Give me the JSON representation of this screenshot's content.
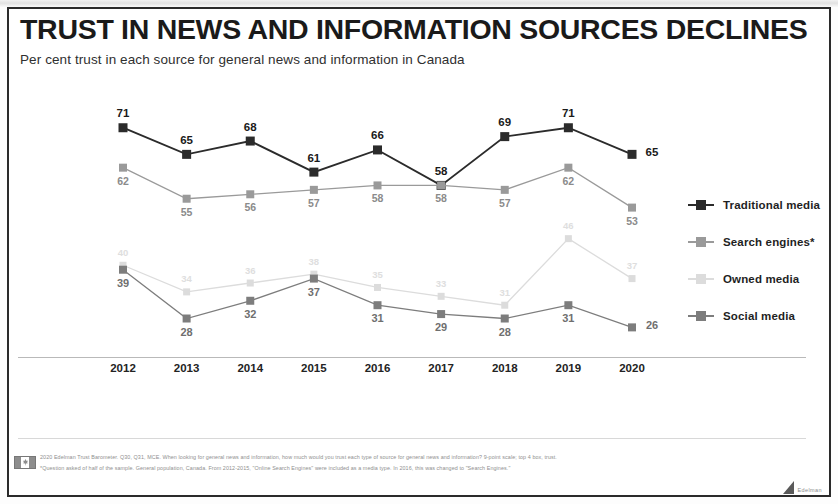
{
  "slide": {
    "title": "TRUST IN NEWS AND INFORMATION SOURCES DECLINES",
    "subtitle": "Per cent trust in each source for general news and information in Canada"
  },
  "legend": {
    "position": "right",
    "items": [
      {
        "label": "Traditional media",
        "color": "#2b2b2b"
      },
      {
        "label": "Search engines*",
        "color": "#9a9a9a"
      },
      {
        "label": "Owned media",
        "color": "#dcdcdc"
      },
      {
        "label": "Social media",
        "color": "#7d7d7d"
      }
    ]
  },
  "footer": {
    "flag_icon": "canada-flag-icon",
    "note": "2020 Edelman Trust Barometer. Q30, Q31, MCE. When looking for general news and information, how much would you trust each type of source for general news and information? 9-point scale; top 4 box, trust. *Question asked of half of the sample. General population, Canada. From 2012-2015, \"Online Search Engines\" were included as a media type. In 2016, this was changed to \"Search Engines.\"",
    "brand": "Edelman"
  },
  "chart_data": {
    "type": "line",
    "title": "TRUST IN NEWS AND INFORMATION SOURCES DECLINES",
    "subtitle": "Per cent trust in each source for general news and information in Canada",
    "xlabel": "",
    "ylabel": "",
    "ylim": [
      20,
      75
    ],
    "grid": false,
    "legend_position": "right",
    "categories": [
      "2012",
      "2013",
      "2014",
      "2015",
      "2016",
      "2017",
      "2018",
      "2019",
      "2020"
    ],
    "series": [
      {
        "name": "Traditional media",
        "color": "#2b2b2b",
        "label_color": "#1a1a1a",
        "label_size": 11.5,
        "label_side": "above",
        "values": [
          71,
          65,
          68,
          61,
          66,
          58,
          69,
          71,
          65
        ],
        "label_overrides": {
          "8": "right"
        }
      },
      {
        "name": "Search engines*",
        "color": "#9a9a9a",
        "label_color": "#8b8b8b",
        "label_size": 10.5,
        "label_side": "below",
        "values": [
          62,
          55,
          56,
          57,
          58,
          58,
          57,
          62,
          53
        ],
        "label_overrides": {
          "7": "below",
          "8": "below"
        }
      },
      {
        "name": "Owned media",
        "color": "#dcdcdc",
        "label_color": "#dedede",
        "label_size": 9.5,
        "label_side": "above",
        "values": [
          40,
          34,
          36,
          38,
          35,
          33,
          31,
          46,
          37
        ]
      },
      {
        "name": "Social media",
        "color": "#7d7d7d",
        "label_color": "#6f6f6f",
        "label_size": 11,
        "label_side": "below",
        "values": [
          39,
          28,
          32,
          37,
          31,
          29,
          28,
          31,
          26
        ],
        "label_overrides": {
          "0": "below",
          "8": "right"
        }
      }
    ]
  }
}
